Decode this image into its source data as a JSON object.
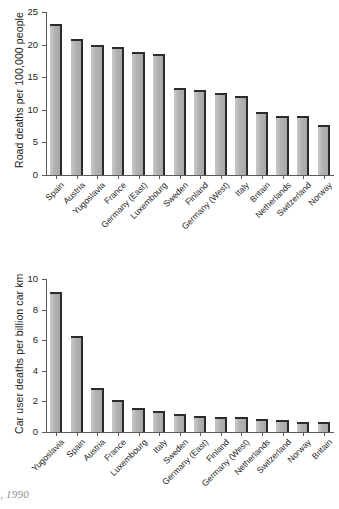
{
  "caption": {
    "text": "Road and car user deaths, 1990",
    "visible_text": "eaths, 1990"
  },
  "style": {
    "bar_face_color": "#b8b8b8",
    "bar_edge_color": "#2b2b2b",
    "axis_color": "#5a5a5a",
    "text_color": "#1f1f1f",
    "caption_color": "#8e8e8e",
    "background": "#ffffff"
  },
  "chart_data": [
    {
      "id": "road-deaths-per-population",
      "type": "bar",
      "title": "",
      "xlabel": "",
      "ylabel": "Road deaths per 100,000 people",
      "ylim": [
        0,
        25
      ],
      "yticks": [
        0,
        5,
        10,
        15,
        20,
        25
      ],
      "ytick_labels": [
        "0",
        "5",
        "10",
        "15",
        "20",
        "25"
      ],
      "grid": false,
      "legend": false,
      "categories": [
        "Spain",
        "Austria",
        "Yugoslavia",
        "France",
        "Germany (East)",
        "Luxembourg",
        "Sweden",
        "Finland",
        "Germany (West)",
        "Italy",
        "Britain",
        "Netherlands",
        "Switzerland",
        "Norway"
      ],
      "values": [
        23.2,
        20.8,
        20.0,
        19.7,
        18.8,
        18.6,
        13.4,
        13.0,
        12.6,
        12.1,
        9.6,
        9.1,
        9.0,
        7.7
      ]
    },
    {
      "id": "car-user-deaths-per-car-km",
      "type": "bar",
      "title": "",
      "xlabel": "",
      "ylabel": "Car user deaths per billion car km",
      "ylim": [
        0,
        10
      ],
      "yticks": [
        0,
        2,
        4,
        6,
        8,
        10
      ],
      "ytick_labels": [
        "0",
        "2",
        "4",
        "6",
        "8",
        "10"
      ],
      "grid": false,
      "legend": false,
      "categories": [
        "Yugoslavia",
        "Spain",
        "Austria",
        "France",
        "Luxembourg",
        "Italy",
        "Sweden",
        "Germany (East)",
        "Finland",
        "Germany (West)",
        "Netherlands",
        "Switzerland",
        "Norway",
        "Britain"
      ],
      "values": [
        9.15,
        6.25,
        2.85,
        2.1,
        1.55,
        1.35,
        1.2,
        1.05,
        0.95,
        0.95,
        0.85,
        0.8,
        0.65,
        0.65
      ]
    }
  ]
}
